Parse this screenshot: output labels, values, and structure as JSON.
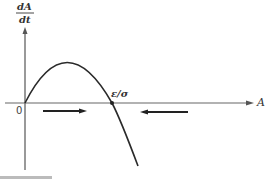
{
  "diagram": {
    "y_axis_label_numerator": "dA",
    "y_axis_label_denominator": "dt",
    "x_axis_label": "A",
    "origin_label": "0",
    "root_label": "ε/σ",
    "colors": {
      "line": "#2a2a2a",
      "axis": "#555555",
      "background": "#ffffff"
    }
  }
}
